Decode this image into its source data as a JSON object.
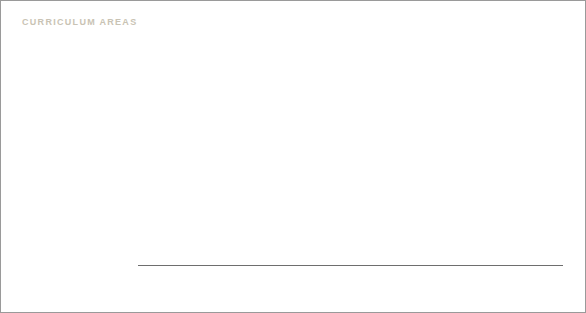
{
  "title": "CURRICULUM AREAS",
  "title_color": "#c9c3b4",
  "legend": {
    "items": [
      {
        "label": "unsatisfactory",
        "color": "#ffffff"
      },
      {
        "label": "fair",
        "color": "#e3e3e3"
      },
      {
        "label": "good",
        "color": "#bfbfbf"
      },
      {
        "label": "very good",
        "color": "#949494"
      }
    ]
  },
  "axis": {
    "ticks": [
      "0%",
      "20%",
      "40%",
      "60%",
      "80%",
      "100%"
    ],
    "tick_values": [
      0,
      20,
      40,
      60,
      80,
      100
    ]
  },
  "chart_data": {
    "type": "bar",
    "orientation": "horizontal",
    "stacked": true,
    "title": "CURRICULUM AREAS",
    "xlabel": "",
    "ylabel": "",
    "xlim": [
      0,
      100
    ],
    "grid": false,
    "legend_position": "bottom",
    "tick_labels": [
      "0%",
      "20%",
      "40%",
      "60%",
      "80%",
      "100%"
    ],
    "categories": [
      "Emotional, personal and social development",
      "Communication and language",
      "Knowledge and understanding of the world",
      "Expressive and aesthetic development",
      "Physical development and movement"
    ],
    "category_lines": [
      [
        "Emotional, personal",
        "and social development"
      ],
      [
        "Communication",
        "and language"
      ],
      [
        "Knowledge and",
        "understanding of the world"
      ],
      [
        "Expressive and",
        "aesthetic development"
      ],
      [
        "Physical development",
        "and movement"
      ]
    ],
    "series": [
      {
        "name": "unsatisfactory",
        "color": "#ffffff",
        "values": [
          0,
          0,
          0,
          0,
          0
        ]
      },
      {
        "name": "fair",
        "color": "#e3e3e3",
        "values": [
          2,
          13,
          13,
          14.5,
          10.5
        ]
      },
      {
        "name": "good",
        "color": "#bfbfbf",
        "values": [
          40.5,
          48,
          52,
          52,
          50.5
        ]
      },
      {
        "name": "very good",
        "color": "#949494",
        "values": [
          57.5,
          39,
          35,
          33.5,
          39
        ]
      }
    ]
  }
}
